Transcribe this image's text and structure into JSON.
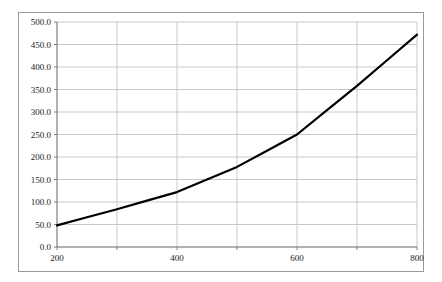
{
  "chart_data": {
    "type": "line",
    "title": "",
    "subtitle": "",
    "xlabel": "",
    "ylabel": "",
    "xlim": [
      200,
      800
    ],
    "ylim": [
      0,
      500
    ],
    "grid": true,
    "legend": null,
    "legend_position": "none",
    "series": [
      {
        "name": "series-1",
        "color": "#000000",
        "line_width": 2.2,
        "x": [
          200,
          250,
          300,
          350,
          400,
          450,
          500,
          550,
          600,
          650,
          700,
          750,
          800
        ],
        "values": [
          48,
          66,
          84,
          103,
          122,
          150,
          178,
          214,
          250,
          304,
          358,
          415,
          472
        ]
      }
    ],
    "x_ticks": [
      200,
      300,
      400,
      500,
      600,
      700,
      800
    ],
    "x_tick_labels": [
      "200",
      "",
      "400",
      "",
      "600",
      "",
      "800"
    ],
    "y_ticks": [
      0,
      50,
      100,
      150,
      200,
      250,
      300,
      350,
      400,
      450,
      500
    ],
    "y_tick_labels": [
      "0.0",
      "50.0",
      "100.0",
      "150.0",
      "200.0",
      "250.0",
      "300.0",
      "350.0",
      "400.0",
      "450.0",
      "500.0"
    ],
    "colors": {
      "background": "#ffffff",
      "frame_border": "#9a9a9a",
      "axis_line": "#808080",
      "gridline": "#c8c8c8",
      "tick_text": "#1a1a1a",
      "series_line": "#000000"
    }
  }
}
